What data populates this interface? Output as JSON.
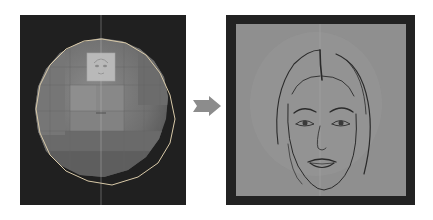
{
  "diagram": {
    "left": {
      "label": "3D sphere mesh with face texture patch",
      "background": "#202020",
      "sphere_fill": "#7f7f7f",
      "wire_color": "#d8c9a8",
      "patch_fill": "#b9b9b9"
    },
    "arrow": {
      "direction": "right",
      "color": "#8c8c8c"
    },
    "right": {
      "label": "Rendered face sketch on flat canvas",
      "frame_color": "#222222",
      "canvas_color": "#8f8f8f",
      "line_color": "#2a2a2a"
    }
  }
}
